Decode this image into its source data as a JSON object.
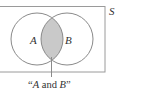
{
  "diagram": {
    "type": "venn",
    "universe_label": "S",
    "sets": [
      {
        "label": "A"
      },
      {
        "label": "B"
      }
    ],
    "highlighted_region": "intersection",
    "caption": {
      "open_quote": "“",
      "a": "A",
      "and": " and ",
      "b": "B",
      "close_quote": "”"
    },
    "colors": {
      "stroke": "#8a8a8a",
      "rect_stroke": "#9a9a9a",
      "shade": "#c9c9c9",
      "text": "#333333",
      "background": "#ffffff"
    }
  }
}
